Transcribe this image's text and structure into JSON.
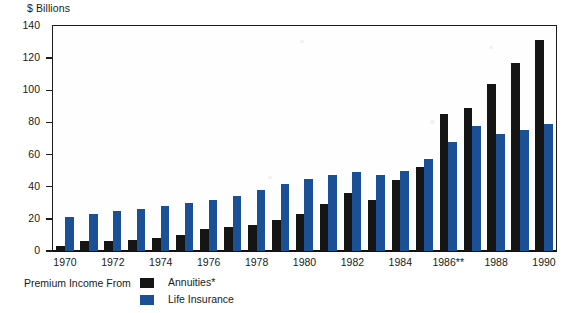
{
  "chart_data": {
    "type": "bar",
    "title": "",
    "subtitle": "",
    "unit_label": "$ Billions",
    "xlabel": "",
    "ylabel": "",
    "ylim": [
      0,
      140
    ],
    "yticks": [
      0,
      20,
      40,
      60,
      80,
      100,
      120,
      140
    ],
    "grid": false,
    "legend_position": "bottom-left",
    "legend_caption": "Premium Income From",
    "categories": [
      "1970",
      "1971",
      "1972",
      "1973",
      "1974",
      "1975",
      "1976",
      "1977",
      "1978",
      "1979",
      "1980",
      "1981",
      "1982",
      "1983",
      "1984",
      "1985",
      "1986**",
      "1987",
      "1988",
      "1989",
      "1990"
    ],
    "tick_labels": [
      "1970",
      "",
      "1972",
      "",
      "1974",
      "",
      "1976",
      "",
      "1978",
      "",
      "1980",
      "",
      "1982",
      "",
      "1984",
      "",
      "1986**",
      "",
      "1988",
      "",
      "1990"
    ],
    "series": [
      {
        "name": "Annuities*",
        "color": "#151515",
        "values": [
          3,
          6,
          6,
          7,
          8,
          10,
          14,
          15,
          16,
          19,
          23,
          29,
          36,
          32,
          44,
          52,
          85,
          89,
          104,
          117,
          131
        ]
      },
      {
        "name": "Life Insurance",
        "color": "#1b4f96",
        "values": [
          21,
          23,
          25,
          26,
          28,
          30,
          32,
          34,
          38,
          42,
          45,
          47,
          49,
          47,
          50,
          57,
          68,
          78,
          73,
          75,
          79
        ]
      }
    ],
    "annotations": [
      "*",
      "**"
    ]
  },
  "axis": {
    "unit_label": "$ Billions"
  },
  "legend": {
    "caption": "Premium Income From",
    "items": [
      {
        "label": "Annuities*",
        "color": "#151515",
        "swatch": "black"
      },
      {
        "label": "Life Insurance",
        "color": "#1b4f96",
        "swatch": "blue"
      }
    ]
  }
}
